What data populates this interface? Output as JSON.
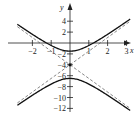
{
  "chart_data": {
    "type": "line",
    "title": "",
    "xlabel": "x",
    "ylabel": "y",
    "xlim": [
      -2.8,
      3.4
    ],
    "ylim": [
      -13,
      6
    ],
    "grid": false,
    "x_ticks": [
      -2,
      -1,
      1,
      2,
      3
    ],
    "x_tick_labels": [
      "−2",
      "−1",
      "1",
      "2",
      "3"
    ],
    "y_ticks": [
      4,
      2,
      -2,
      -4,
      -6,
      -8,
      -10,
      -12
    ],
    "y_tick_labels": [
      "4",
      "2",
      "−2",
      "−4",
      "−6",
      "−8",
      "−10",
      "−12"
    ],
    "center": [
      0,
      -4
    ],
    "series": [
      {
        "name": "hyperbola upper branch",
        "style": "solid",
        "vertex": [
          0,
          -1.5
        ],
        "x": [
          -2.8,
          -2,
          -1,
          0,
          1,
          2,
          3.2
        ],
        "y": [
          5.5,
          2.2,
          -0.1,
          -1.5,
          -0.1,
          2.2,
          5.5
        ]
      },
      {
        "name": "hyperbola lower branch",
        "style": "solid",
        "vertex": [
          0,
          -6.5
        ],
        "x": [
          -2.8,
          -2,
          -1,
          0,
          1,
          2,
          3.2
        ],
        "y": [
          -13.5,
          -10.2,
          -7.9,
          -6.5,
          -7.9,
          -10.2,
          -13.5
        ]
      },
      {
        "name": "asymptote 1",
        "style": "dashed",
        "x": [
          -2.8,
          3.2
        ],
        "y": [
          5.8,
          -13.8
        ]
      },
      {
        "name": "asymptote 2",
        "style": "dashed",
        "x": [
          -2.8,
          3.2
        ],
        "y": [
          -13.8,
          5.8
        ]
      }
    ],
    "annotations": [
      {
        "text": "point",
        "at": [
          0,
          -4
        ]
      }
    ]
  }
}
